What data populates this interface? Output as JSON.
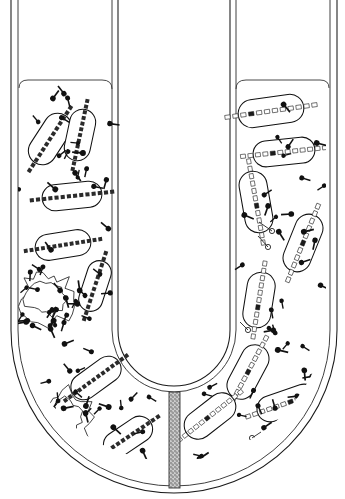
{
  "figure": {
    "title": "U-tube experiment: phage infection across a bacteria-proof filter",
    "type": "scientific-diagram",
    "background_color": "#ffffff",
    "ink_color": "#111111",
    "canvas": {
      "width": 345,
      "height": 499
    }
  },
  "apparatus": {
    "name": "u-tube",
    "wall_style": "double-line glass outline",
    "outer_wall_color": "#1a1a1a",
    "inner_wall_color": "#2a2a2a",
    "left_arm": {
      "label": "left-arm",
      "outer_wall_x": 11,
      "inner_wall_x": 18,
      "liquid_level_y": 88
    },
    "right_arm": {
      "label": "right-arm",
      "inner_wall_x": 327,
      "outer_wall_x": 334,
      "liquid_level_y": 88
    },
    "bend": {
      "label": "u-bend",
      "center_x": 174,
      "center_y": 330,
      "outer_radius": 163,
      "inner_radius": 56
    }
  },
  "filter": {
    "name": "sintered-glass-filter",
    "orientation": "vertical",
    "x": 169,
    "y": 392,
    "width": 11,
    "height": 96,
    "fill_pattern": "stipple",
    "fill_color": "#b9b9b9"
  },
  "legend_semantics": {
    "left_compartment_contents": "bacteria with solid dark (labelled) chromosomes, free phage particles, two lysed cells",
    "right_compartment_contents": "bacteria with light (unlabelled) chromosomes carrying one dark segment, free phage particles, empty phage ghosts attached to cell walls",
    "phage_glyph": "dark round head with straight tail",
    "ghost_glyph": "open circle head with thin tail"
  },
  "chart_data": {
    "type": "diagram",
    "title": "U-tube experiment: phage infection across a bacteria-proof filter",
    "compartments": [
      {
        "name": "left",
        "bacteria_count": 6,
        "lysed_cell_count": 2,
        "free_phage_count": 46,
        "ghost_count": 0,
        "chromosome_type": "solid-dark"
      },
      {
        "name": "right",
        "bacteria_count": 8,
        "lysed_cell_count": 0,
        "free_phage_count": 38,
        "ghost_count": 4,
        "chromosome_type": "light-with-dark-segment"
      }
    ]
  },
  "cells_left": [
    {
      "name": "cell-L1",
      "cx": 50,
      "cy": 139,
      "rx": 28,
      "ry": 14,
      "rot": -57,
      "chrom": "dark",
      "segments": 13
    },
    {
      "name": "cell-L2",
      "cx": 80,
      "cy": 135,
      "rx": 26,
      "ry": 13,
      "rot": -78,
      "chrom": "dark",
      "segments": 13
    },
    {
      "name": "cell-L3",
      "cx": 72,
      "cy": 196,
      "rx": 30,
      "ry": 13,
      "rot": -6,
      "chrom": "dark",
      "segments": 14
    },
    {
      "name": "cell-L4",
      "cx": 63,
      "cy": 245,
      "rx": 28,
      "ry": 13,
      "rot": -9,
      "chrom": "dark",
      "segments": 14
    },
    {
      "name": "cell-L5",
      "cx": 95,
      "cy": 286,
      "rx": 26,
      "ry": 12,
      "rot": -72,
      "chrom": "dark",
      "segments": 12
    },
    {
      "name": "cell-L6",
      "cx": 96,
      "cy": 378,
      "rx": 28,
      "ry": 13,
      "rot": -36,
      "chrom": "dark",
      "segments": 14
    },
    {
      "name": "cell-L7",
      "cx": 128,
      "cy": 437,
      "rx": 27,
      "ry": 13,
      "rot": -34,
      "chrom": "dark",
      "segments": 13
    }
  ],
  "cells_right": [
    {
      "name": "cell-R1",
      "cx": 271,
      "cy": 111,
      "rx": 33,
      "ry": 14,
      "rot": -8,
      "chrom": "light",
      "segments": 12,
      "hot_index": 3
    },
    {
      "name": "cell-R2",
      "cx": 284,
      "cy": 152,
      "rx": 31,
      "ry": 13,
      "rot": -6,
      "chrom": "light",
      "segments": 12,
      "hot_index": 4
    },
    {
      "name": "cell-R3",
      "cx": 256,
      "cy": 202,
      "rx": 14,
      "ry": 31,
      "rot": -10,
      "chrom": "light",
      "segments": 12,
      "hot_index": 6
    },
    {
      "name": "cell-R4",
      "cx": 303,
      "cy": 243,
      "rx": 14,
      "ry": 30,
      "rot": 22,
      "chrom": "light",
      "segments": 11,
      "hot_index": 5
    },
    {
      "name": "cell-R5",
      "cx": 259,
      "cy": 300,
      "rx": 14,
      "ry": 28,
      "rot": 9,
      "chrom": "light",
      "segments": 11,
      "hot_index": 6
    },
    {
      "name": "cell-R6",
      "cx": 248,
      "cy": 372,
      "rx": 14,
      "ry": 29,
      "rot": 28,
      "chrom": "light",
      "segments": 11,
      "hot_index": 5
    },
    {
      "name": "cell-R7",
      "cx": 210,
      "cy": 416,
      "rx": 29,
      "ry": 14,
      "rot": -38,
      "chrom": "light",
      "segments": 12,
      "hot_index": 5
    },
    {
      "name": "cell-R8",
      "cx": 287,
      "cy": 403,
      "rx": 31,
      "ry": 13,
      "rot": -19,
      "chrom": "light",
      "segments": 12,
      "hot_index": 6
    }
  ],
  "lysed_cells": [
    {
      "name": "lysed-cell-1",
      "cx": 46,
      "cy": 299,
      "r": 29
    },
    {
      "name": "lysed-cell-2",
      "cx": 65,
      "cy": 417,
      "r": 30
    }
  ],
  "ghosts": [
    {
      "name": "phage-ghost-1",
      "cx": 272,
      "cy": 231,
      "ax": 259,
      "ay": 222
    },
    {
      "name": "phage-ghost-2",
      "cx": 268,
      "cy": 247,
      "ax": 258,
      "ay": 236
    },
    {
      "name": "phage-ghost-3",
      "cx": 248,
      "cy": 330,
      "ax": 240,
      "ay": 322
    },
    {
      "name": "phage-ghost-4",
      "cx": 252,
      "cy": 438,
      "ax": 261,
      "ay": 432
    }
  ]
}
